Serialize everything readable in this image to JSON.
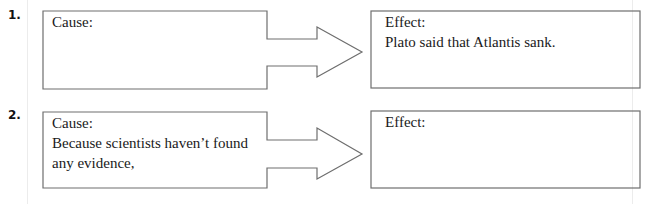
{
  "items": [
    {
      "number": "1.",
      "cause": {
        "label": "Cause:",
        "lines": [
          "",
          ""
        ]
      },
      "effect": {
        "label": "Effect:",
        "lines": [
          "Plato said that Atlantis sank."
        ]
      }
    },
    {
      "number": "2.",
      "cause": {
        "label": "Cause:",
        "lines": [
          "Because scientists haven’t found",
          "any evidence,"
        ]
      },
      "effect": {
        "label": "Effect:",
        "lines": [
          ""
        ]
      }
    }
  ],
  "colors": {
    "stroke": "#6e6e6e",
    "text": "#1a1a1a"
  }
}
